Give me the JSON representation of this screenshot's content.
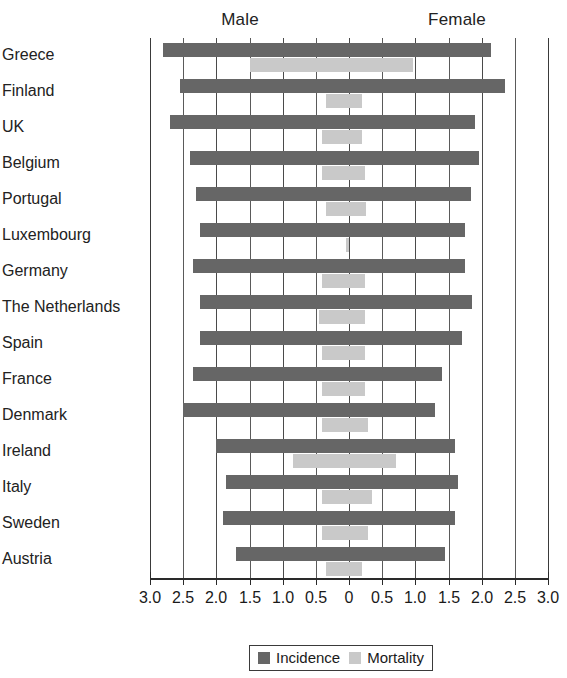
{
  "chart_data": {
    "type": "bar",
    "orientation": "horizontal-diverging",
    "title": "",
    "subtitle": "",
    "xlabel": "",
    "ylabel": "",
    "grid": true,
    "legend_position": "bottom-center",
    "axis": {
      "center_value": 0,
      "left_label": "Male",
      "right_label": "Female",
      "xlim": [
        -3.0,
        3.0
      ],
      "tick_step": 0.5,
      "tick_labels": [
        "3.0",
        "2.5",
        "2.0",
        "1.5",
        "1.0",
        "0.5",
        "0",
        "0.5",
        "1.0",
        "1.5",
        "2.0",
        "2.5",
        "3.0"
      ],
      "tick_values": [
        -3.0,
        -2.5,
        -2.0,
        -1.5,
        -1.0,
        -0.5,
        0,
        0.5,
        1.0,
        1.5,
        2.0,
        2.5,
        3.0
      ]
    },
    "categories": [
      "Greece",
      "Finland",
      "UK",
      "Belgium",
      "Portugal",
      "Luxembourg",
      "Germany",
      "The Netherlands",
      "Spain",
      "France",
      "Denmark",
      "Ireland",
      "Italy",
      "Sweden",
      "Austria"
    ],
    "series": [
      {
        "name": "Incidence",
        "color": "#666666",
        "male": [
          2.8,
          2.55,
          2.7,
          2.4,
          2.3,
          2.25,
          2.35,
          2.25,
          2.25,
          2.35,
          2.5,
          2.0,
          1.85,
          1.9,
          1.7
        ],
        "female": [
          2.15,
          2.35,
          1.9,
          1.95,
          1.85,
          1.75,
          1.75,
          1.85,
          1.7,
          1.4,
          1.3,
          1.6,
          1.65,
          1.6,
          1.45
        ]
      },
      {
        "name": "Mortality",
        "color": "#c9c9c9",
        "male": [
          1.5,
          0.35,
          0.4,
          0.4,
          0.35,
          0.05,
          0.4,
          0.45,
          0.4,
          0.4,
          0.4,
          0.85,
          0.4,
          0.4,
          0.35
        ],
        "female": [
          0.95,
          0.2,
          0.2,
          0.25,
          0.25,
          0.0,
          0.25,
          0.25,
          0.25,
          0.25,
          0.3,
          0.7,
          0.35,
          0.3,
          0.2
        ]
      }
    ]
  },
  "legend": {
    "items": [
      {
        "label": "Incidence",
        "swatch": "incidence"
      },
      {
        "label": "Mortality",
        "swatch": "mortality"
      }
    ]
  }
}
